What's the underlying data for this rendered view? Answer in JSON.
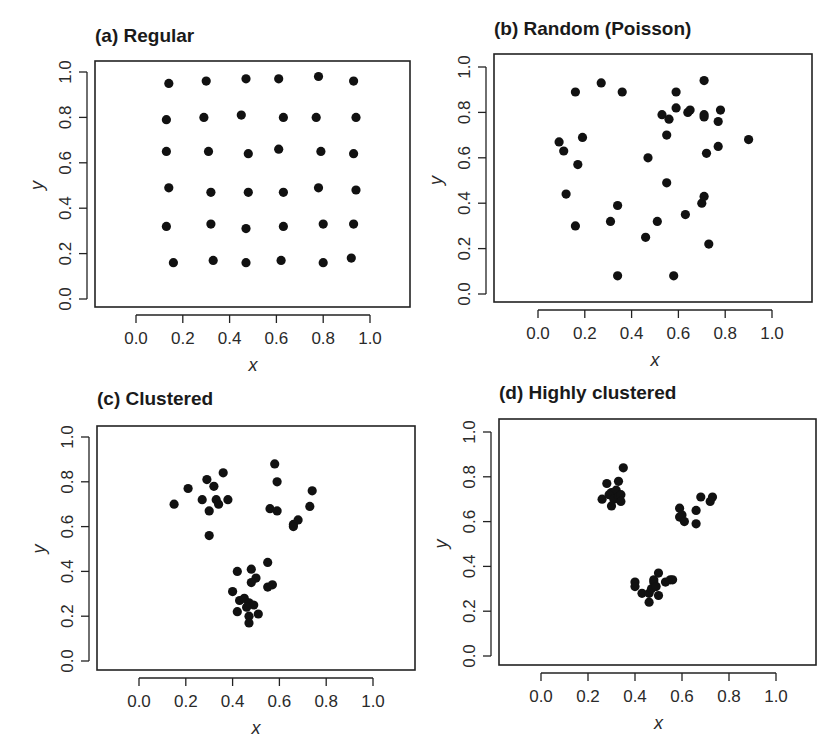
{
  "figure": {
    "caption_fragment": ""
  },
  "chart_data": [
    {
      "type": "scatter",
      "id": "a",
      "title": "(a) Regular",
      "xlabel": "x",
      "ylabel": "y",
      "xlim": [
        -0.18,
        1.18
      ],
      "ylim": [
        -0.04,
        1.04
      ],
      "xticks": [
        "0.0",
        "0.2",
        "0.4",
        "0.6",
        "0.8",
        "1.0"
      ],
      "yticks": [
        "0.0",
        "0.2",
        "0.4",
        "0.6",
        "0.8",
        "1.0"
      ],
      "grid": false,
      "layout": {
        "frame": [
          95,
          61,
          410,
          307
        ],
        "x0": 136,
        "xs": 234,
        "y0": 299,
        "ys": 227
      },
      "points": [
        [
          0.14,
          0.95
        ],
        [
          0.3,
          0.96
        ],
        [
          0.47,
          0.97
        ],
        [
          0.61,
          0.97
        ],
        [
          0.78,
          0.98
        ],
        [
          0.93,
          0.96
        ],
        [
          0.13,
          0.79
        ],
        [
          0.29,
          0.8
        ],
        [
          0.45,
          0.81
        ],
        [
          0.63,
          0.8
        ],
        [
          0.77,
          0.8
        ],
        [
          0.94,
          0.8
        ],
        [
          0.13,
          0.65
        ],
        [
          0.31,
          0.65
        ],
        [
          0.48,
          0.64
        ],
        [
          0.61,
          0.66
        ],
        [
          0.79,
          0.65
        ],
        [
          0.93,
          0.64
        ],
        [
          0.14,
          0.49
        ],
        [
          0.32,
          0.47
        ],
        [
          0.48,
          0.47
        ],
        [
          0.63,
          0.47
        ],
        [
          0.78,
          0.49
        ],
        [
          0.94,
          0.48
        ],
        [
          0.13,
          0.32
        ],
        [
          0.32,
          0.33
        ],
        [
          0.47,
          0.31
        ],
        [
          0.63,
          0.32
        ],
        [
          0.8,
          0.33
        ],
        [
          0.93,
          0.33
        ],
        [
          0.16,
          0.16
        ],
        [
          0.33,
          0.17
        ],
        [
          0.47,
          0.16
        ],
        [
          0.62,
          0.17
        ],
        [
          0.8,
          0.16
        ],
        [
          0.92,
          0.18
        ]
      ]
    },
    {
      "type": "scatter",
      "id": "b",
      "title": "(b) Random (Poisson)",
      "xlabel": "x",
      "ylabel": "y",
      "xlim": [
        -0.18,
        1.18
      ],
      "ylim": [
        -0.04,
        1.04
      ],
      "xticks": [
        "0.0",
        "0.2",
        "0.4",
        "0.6",
        "0.8",
        "1.0"
      ],
      "yticks": [
        "0.0",
        "0.2",
        "0.4",
        "0.6",
        "0.8",
        "1.0"
      ],
      "grid": false,
      "layout": {
        "frame": [
          494,
          54,
          812,
          302
        ],
        "x0": 538,
        "xs": 234,
        "y0": 294,
        "ys": 227
      },
      "points": [
        [
          0.16,
          0.89
        ],
        [
          0.27,
          0.93
        ],
        [
          0.36,
          0.89
        ],
        [
          0.71,
          0.94
        ],
        [
          0.59,
          0.89
        ],
        [
          0.53,
          0.79
        ],
        [
          0.56,
          0.77
        ],
        [
          0.59,
          0.82
        ],
        [
          0.64,
          0.8
        ],
        [
          0.65,
          0.81
        ],
        [
          0.71,
          0.79
        ],
        [
          0.71,
          0.78
        ],
        [
          0.77,
          0.76
        ],
        [
          0.78,
          0.81
        ],
        [
          0.9,
          0.68
        ],
        [
          0.09,
          0.67
        ],
        [
          0.11,
          0.63
        ],
        [
          0.19,
          0.69
        ],
        [
          0.17,
          0.57
        ],
        [
          0.47,
          0.6
        ],
        [
          0.55,
          0.7
        ],
        [
          0.72,
          0.62
        ],
        [
          0.77,
          0.65
        ],
        [
          0.55,
          0.49
        ],
        [
          0.12,
          0.44
        ],
        [
          0.16,
          0.3
        ],
        [
          0.31,
          0.32
        ],
        [
          0.34,
          0.39
        ],
        [
          0.51,
          0.32
        ],
        [
          0.46,
          0.25
        ],
        [
          0.63,
          0.35
        ],
        [
          0.7,
          0.4
        ],
        [
          0.71,
          0.43
        ],
        [
          0.73,
          0.22
        ],
        [
          0.34,
          0.08
        ],
        [
          0.58,
          0.08
        ]
      ]
    },
    {
      "type": "scatter",
      "id": "c",
      "title": "(c) Clustered",
      "xlabel": "x",
      "ylabel": "y",
      "xlim": [
        -0.18,
        1.18
      ],
      "ylim": [
        -0.04,
        1.04
      ],
      "xticks": [
        "0.0",
        "0.2",
        "0.4",
        "0.6",
        "0.8",
        "1.0"
      ],
      "yticks": [
        "0.0",
        "0.2",
        "0.4",
        "0.6",
        "0.8",
        "1.0"
      ],
      "grid": false,
      "layout": {
        "frame": [
          97,
          426,
          415,
          670
        ],
        "x0": 139,
        "xs": 234,
        "y0": 661,
        "ys": 224
      },
      "points": [
        [
          0.15,
          0.7
        ],
        [
          0.21,
          0.77
        ],
        [
          0.27,
          0.72
        ],
        [
          0.29,
          0.81
        ],
        [
          0.3,
          0.67
        ],
        [
          0.32,
          0.78
        ],
        [
          0.33,
          0.72
        ],
        [
          0.34,
          0.7
        ],
        [
          0.36,
          0.84
        ],
        [
          0.38,
          0.72
        ],
        [
          0.3,
          0.56
        ],
        [
          0.58,
          0.88
        ],
        [
          0.59,
          0.8
        ],
        [
          0.56,
          0.68
        ],
        [
          0.59,
          0.67
        ],
        [
          0.66,
          0.61
        ],
        [
          0.68,
          0.63
        ],
        [
          0.73,
          0.69
        ],
        [
          0.74,
          0.76
        ],
        [
          0.66,
          0.6
        ],
        [
          0.42,
          0.4
        ],
        [
          0.48,
          0.41
        ],
        [
          0.55,
          0.44
        ],
        [
          0.5,
          0.37
        ],
        [
          0.48,
          0.35
        ],
        [
          0.55,
          0.33
        ],
        [
          0.57,
          0.34
        ],
        [
          0.4,
          0.31
        ],
        [
          0.43,
          0.27
        ],
        [
          0.45,
          0.28
        ],
        [
          0.47,
          0.26
        ],
        [
          0.49,
          0.25
        ],
        [
          0.46,
          0.24
        ],
        [
          0.42,
          0.22
        ],
        [
          0.51,
          0.21
        ],
        [
          0.47,
          0.2
        ],
        [
          0.47,
          0.17
        ]
      ]
    },
    {
      "type": "scatter",
      "id": "d",
      "title": "(d) Highly clustered",
      "xlabel": "x",
      "ylabel": "y",
      "xlim": [
        -0.18,
        1.18
      ],
      "ylim": [
        -0.04,
        1.04
      ],
      "xticks": [
        "0.0",
        "0.2",
        "0.4",
        "0.6",
        "0.8",
        "1.0"
      ],
      "yticks": [
        "0.0",
        "0.2",
        "0.4",
        "0.6",
        "0.8",
        "1.0"
      ],
      "grid": false,
      "layout": {
        "frame": [
          499,
          419,
          816,
          665
        ],
        "x0": 541,
        "xs": 235,
        "y0": 656,
        "ys": 224
      },
      "points": [
        [
          0.35,
          0.84
        ],
        [
          0.28,
          0.77
        ],
        [
          0.33,
          0.78
        ],
        [
          0.3,
          0.73
        ],
        [
          0.32,
          0.74
        ],
        [
          0.26,
          0.7
        ],
        [
          0.29,
          0.72
        ],
        [
          0.31,
          0.7
        ],
        [
          0.33,
          0.71
        ],
        [
          0.34,
          0.72
        ],
        [
          0.34,
          0.69
        ],
        [
          0.3,
          0.67
        ],
        [
          0.59,
          0.66
        ],
        [
          0.6,
          0.63
        ],
        [
          0.59,
          0.62
        ],
        [
          0.61,
          0.6
        ],
        [
          0.66,
          0.65
        ],
        [
          0.68,
          0.71
        ],
        [
          0.73,
          0.71
        ],
        [
          0.72,
          0.69
        ],
        [
          0.66,
          0.59
        ],
        [
          0.4,
          0.33
        ],
        [
          0.4,
          0.31
        ],
        [
          0.43,
          0.28
        ],
        [
          0.46,
          0.28
        ],
        [
          0.47,
          0.3
        ],
        [
          0.48,
          0.33
        ],
        [
          0.48,
          0.34
        ],
        [
          0.5,
          0.37
        ],
        [
          0.5,
          0.27
        ],
        [
          0.53,
          0.33
        ],
        [
          0.55,
          0.34
        ],
        [
          0.56,
          0.34
        ],
        [
          0.46,
          0.24
        ],
        [
          0.49,
          0.31
        ]
      ]
    }
  ]
}
